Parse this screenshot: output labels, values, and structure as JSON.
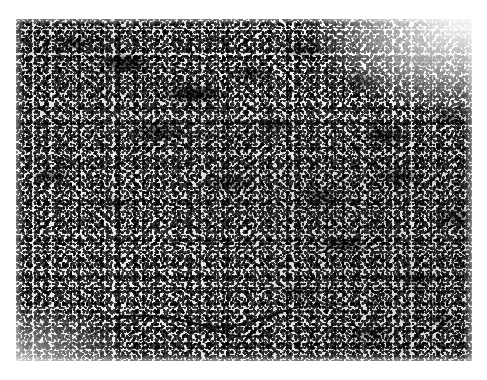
{
  "figure": {
    "kind": "histopathology-micrograph",
    "staining": "hematoxylin-and-eosin (grayscale reproduction)",
    "modality": "light-microscopy-photomicrograph",
    "color_mode": "grayscale",
    "caption": "",
    "label": "",
    "magnification_marker": "",
    "scale_bar": ""
  },
  "canvas": {
    "width_px": 487,
    "height_px": 380,
    "background_color": "#ffffff",
    "margin_color": "#ffffff"
  },
  "plate": {
    "left_px": 16,
    "top_px": 19,
    "width_px": 456,
    "height_px": 342,
    "border": "none",
    "base_tone": "#d4d4d4",
    "darkest_tone": "#0a0a0a",
    "lightest_tone": "#f4f4f4",
    "mid_tone": "#8d8d8d"
  },
  "tissue_regions": [
    {
      "name": "dense-dark-cellular-bands-upper",
      "description": "Anastomosing ribbons and clusters of densely packed darkly stained nuclei occupying the upper two thirds of the field",
      "tone": "#101010"
    },
    {
      "name": "pale-sinusoidal-stromal-spaces",
      "description": "Irregular pale lacunar spaces separating the dark cellular cords",
      "tone": "#eceaea"
    },
    {
      "name": "uniform-lymphoid-field-lower-left",
      "description": "Evenly dispersed fine small round nuclei forming a monotonous speckled sheet in the lower left quadrant",
      "tone": "#b7b7b7"
    },
    {
      "name": "fibrous-septa-streaks",
      "description": "Thin branching dark linear fibrous strands crossing the lower central field",
      "tone": "#0b0b0b"
    },
    {
      "name": "faded-corner-upper-right",
      "description": "Lighter, washed-out photographic corner at the top right of the print",
      "tone": "#f2f2f2"
    }
  ],
  "septa_paths": [
    "M 96 300 C 130 292, 158 300, 186 306 C 214 312, 240 302, 268 292",
    "M 186 306 C 206 316, 228 320, 252 316",
    "M 60 322 C 84 312, 104 306, 122 304",
    "M 268 292 C 292 284, 312 286, 332 294",
    "M 40 150 C 70 140, 96 146, 118 156",
    "M 150 118 C 176 110, 200 116, 222 124"
  ]
}
